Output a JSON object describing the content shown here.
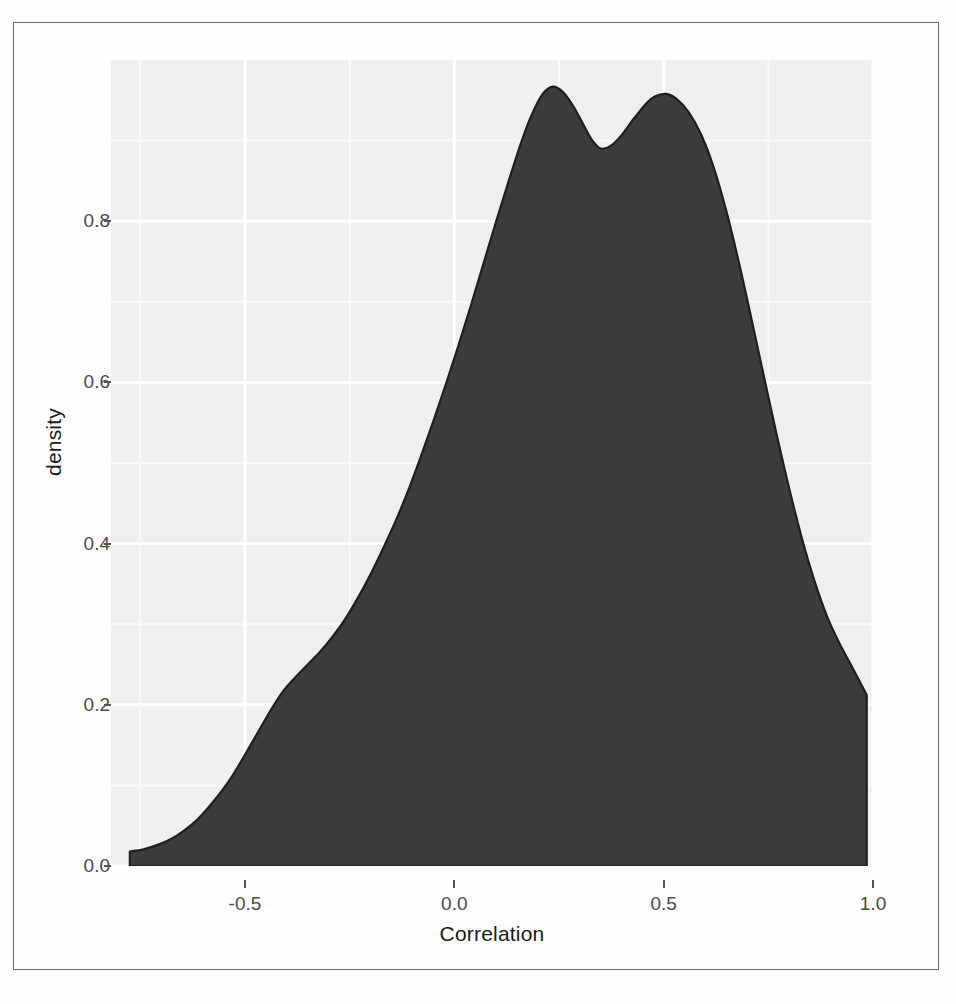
{
  "figure": {
    "frame_border_color": "#6e6e6e",
    "background_color": "#ffffff"
  },
  "chart_data": {
    "type": "area",
    "title": "",
    "subtitle": "",
    "xlabel": "Correlation",
    "ylabel": "density",
    "xlim": [
      -0.82,
      1.0
    ],
    "ylim": [
      0.0,
      1.0
    ],
    "xticks": [
      -0.5,
      0.0,
      0.5,
      1.0
    ],
    "xtick_labels": [
      "-0.5",
      "0.0",
      "0.5",
      "1.0"
    ],
    "yticks": [
      0.0,
      0.2,
      0.4,
      0.6,
      0.8
    ],
    "ytick_labels": [
      "0.0",
      "0.2",
      "0.4",
      "0.6",
      "0.8"
    ],
    "grid": true,
    "grid_major_color": "#ffffff",
    "grid_minor_color": "#fafafa",
    "panel_background": "#f0f0f0",
    "legend": null,
    "legend_position": "none",
    "series": [
      {
        "name": "density",
        "fill_color": "#3c3c3c",
        "line_color": "#1f1f1f",
        "x": [
          -0.775,
          -0.76,
          -0.74,
          -0.715,
          -0.69,
          -0.665,
          -0.64,
          -0.615,
          -0.59,
          -0.56,
          -0.53,
          -0.5,
          -0.47,
          -0.44,
          -0.41,
          -0.38,
          -0.35,
          -0.32,
          -0.29,
          -0.26,
          -0.23,
          -0.2,
          -0.17,
          -0.14,
          -0.11,
          -0.08,
          -0.05,
          -0.02,
          0.01,
          0.04,
          0.07,
          0.1,
          0.13,
          0.16,
          0.185,
          0.21,
          0.235,
          0.26,
          0.285,
          0.31,
          0.33,
          0.35,
          0.375,
          0.4,
          0.43,
          0.46,
          0.48,
          0.505,
          0.53,
          0.56,
          0.59,
          0.62,
          0.65,
          0.68,
          0.71,
          0.74,
          0.77,
          0.8,
          0.83,
          0.86,
          0.89,
          0.92,
          0.95,
          0.985
        ],
        "y": [
          0.018,
          0.019,
          0.021,
          0.025,
          0.03,
          0.037,
          0.046,
          0.057,
          0.071,
          0.09,
          0.112,
          0.138,
          0.165,
          0.192,
          0.216,
          0.234,
          0.25,
          0.266,
          0.285,
          0.307,
          0.333,
          0.362,
          0.394,
          0.428,
          0.466,
          0.508,
          0.552,
          0.598,
          0.646,
          0.696,
          0.748,
          0.8,
          0.85,
          0.898,
          0.932,
          0.957,
          0.967,
          0.96,
          0.942,
          0.918,
          0.9,
          0.89,
          0.894,
          0.907,
          0.928,
          0.947,
          0.955,
          0.958,
          0.952,
          0.935,
          0.907,
          0.866,
          0.812,
          0.748,
          0.678,
          0.606,
          0.535,
          0.468,
          0.407,
          0.354,
          0.31,
          0.276,
          0.247,
          0.212
        ],
        "baseline": 0.0,
        "peaks": [
          {
            "x": 0.21,
            "y": 0.957,
            "label": "first mode"
          },
          {
            "x": 0.505,
            "y": 0.958,
            "label": "second mode"
          }
        ],
        "valley": {
          "x": 0.35,
          "y": 0.89
        },
        "right_edge_drop": {
          "x": 0.985,
          "from": 0.212,
          "to": 0.0
        }
      }
    ]
  }
}
